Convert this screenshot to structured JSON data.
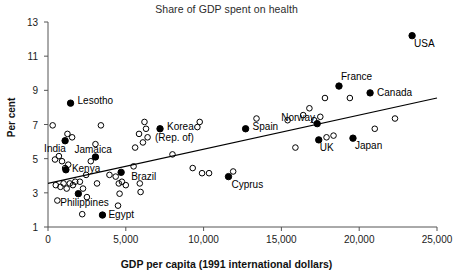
{
  "chart_data": {
    "type": "scatter",
    "title": "Share of GDP spent on health",
    "xlabel": "GDP per capita (1991 international dollars)",
    "ylabel": "Per cent",
    "xlim": [
      0,
      25000
    ],
    "ylim": [
      1,
      13
    ],
    "grid": false,
    "legend": "none",
    "xticks": [
      0,
      5000,
      10000,
      15000,
      20000,
      25000
    ],
    "xtick_labels": [
      "0",
      "5,000",
      "10,000",
      "15,000",
      "20,000",
      "25,000"
    ],
    "yticks": [
      1,
      3,
      5,
      7,
      9,
      11,
      13
    ],
    "ytick_labels": [
      "1",
      "3",
      "5",
      "7",
      "9",
      "11",
      "13"
    ],
    "marker_styles": {
      "labelled": "filled-circle",
      "unlabelled": "open-circle"
    },
    "trendline": {
      "type": "linear-fit",
      "x": [
        0,
        25000
      ],
      "y": [
        3.55,
        8.55
      ]
    },
    "labelled_points": [
      {
        "name": "USA",
        "x": 23400,
        "y": 12.2,
        "label_dx": 2,
        "label_dy": 11
      },
      {
        "name": "France",
        "x": 18700,
        "y": 9.25,
        "label_dx": 2,
        "label_dy": -6
      },
      {
        "name": "Canada",
        "x": 20700,
        "y": 8.85,
        "label_dx": 7,
        "label_dy": 3
      },
      {
        "name": "Lesotho",
        "x": 1450,
        "y": 8.25,
        "label_dx": 7,
        "label_dy": 1
      },
      {
        "name": "Norway",
        "x": 17300,
        "y": 7.05,
        "label_dx": -36,
        "label_dy": -3
      },
      {
        "name": "Spain",
        "x": 12700,
        "y": 6.75,
        "label_dx": 7,
        "label_dy": 1
      },
      {
        "name": "Korea (Rep. of)",
        "x": 7200,
        "y": 6.75,
        "label_dx": 7,
        "label_dy": 1
      },
      {
        "name": "Japan",
        "x": 19600,
        "y": 6.2,
        "label_dx": 2,
        "label_dy": 11
      },
      {
        "name": "UK",
        "x": 17400,
        "y": 6.1,
        "label_dx": 1,
        "label_dy": 11
      },
      {
        "name": "India",
        "x": 1100,
        "y": 6.05,
        "label_dx": -21,
        "label_dy": 11
      },
      {
        "name": "Jamaica",
        "x": 3050,
        "y": 5.1,
        "label_dx": -21,
        "label_dy": -4
      },
      {
        "name": "Kenya",
        "x": 1150,
        "y": 4.35,
        "label_dx": 6,
        "label_dy": 2
      },
      {
        "name": "Brazil",
        "x": 4700,
        "y": 4.2,
        "label_dx": 10,
        "label_dy": 8
      },
      {
        "name": "Cyprus",
        "x": 11600,
        "y": 3.95,
        "label_dx": 3,
        "label_dy": 11
      },
      {
        "name": "Philippines",
        "x": 1950,
        "y": 2.95,
        "label_dx": -18,
        "label_dy": 12
      },
      {
        "name": "Egypt",
        "x": 3500,
        "y": 1.7,
        "label_dx": 6,
        "label_dy": 3
      }
    ],
    "unlabelled_points": [
      {
        "x": 300,
        "y": 6.95
      },
      {
        "x": 700,
        "y": 5.15
      },
      {
        "x": 450,
        "y": 4.95
      },
      {
        "x": 900,
        "y": 4.85
      },
      {
        "x": 1250,
        "y": 6.45
      },
      {
        "x": 1550,
        "y": 6.25
      },
      {
        "x": 1300,
        "y": 4.65
      },
      {
        "x": 1100,
        "y": 4.45
      },
      {
        "x": 500,
        "y": 3.45
      },
      {
        "x": 800,
        "y": 3.35
      },
      {
        "x": 1000,
        "y": 3.55
      },
      {
        "x": 1200,
        "y": 3.25
      },
      {
        "x": 1400,
        "y": 3.55
      },
      {
        "x": 1600,
        "y": 3.45
      },
      {
        "x": 1750,
        "y": 3.65
      },
      {
        "x": 2050,
        "y": 3.65
      },
      {
        "x": 2250,
        "y": 3.25
      },
      {
        "x": 600,
        "y": 2.55
      },
      {
        "x": 2200,
        "y": 1.75
      },
      {
        "x": 3400,
        "y": 6.95
      },
      {
        "x": 3050,
        "y": 5.85
      },
      {
        "x": 2750,
        "y": 4.85
      },
      {
        "x": 2450,
        "y": 4.05
      },
      {
        "x": 3150,
        "y": 3.55
      },
      {
        "x": 2500,
        "y": 2.75
      },
      {
        "x": 3950,
        "y": 4.05
      },
      {
        "x": 4350,
        "y": 3.95
      },
      {
        "x": 4550,
        "y": 3.55
      },
      {
        "x": 4750,
        "y": 3.65
      },
      {
        "x": 5000,
        "y": 3.45
      },
      {
        "x": 4600,
        "y": 2.95
      },
      {
        "x": 4500,
        "y": 2.25
      },
      {
        "x": 5600,
        "y": 5.65
      },
      {
        "x": 5500,
        "y": 4.55
      },
      {
        "x": 5900,
        "y": 3.55
      },
      {
        "x": 5950,
        "y": 3.05
      },
      {
        "x": 6100,
        "y": 5.95
      },
      {
        "x": 6400,
        "y": 6.25
      },
      {
        "x": 6300,
        "y": 6.75
      },
      {
        "x": 5850,
        "y": 6.45
      },
      {
        "x": 6200,
        "y": 7.15
      },
      {
        "x": 8000,
        "y": 5.25
      },
      {
        "x": 9300,
        "y": 4.45
      },
      {
        "x": 9900,
        "y": 4.15
      },
      {
        "x": 10350,
        "y": 4.15
      },
      {
        "x": 9750,
        "y": 7.15
      },
      {
        "x": 9600,
        "y": 6.85
      },
      {
        "x": 11900,
        "y": 4.25
      },
      {
        "x": 15900,
        "y": 5.65
      },
      {
        "x": 15400,
        "y": 7.25
      },
      {
        "x": 16400,
        "y": 7.55
      },
      {
        "x": 16800,
        "y": 7.95
      },
      {
        "x": 17500,
        "y": 7.45
      },
      {
        "x": 17100,
        "y": 7.25
      },
      {
        "x": 17900,
        "y": 6.25
      },
      {
        "x": 18350,
        "y": 6.35
      },
      {
        "x": 17800,
        "y": 8.55
      },
      {
        "x": 19400,
        "y": 8.55
      },
      {
        "x": 21000,
        "y": 6.75
      },
      {
        "x": 22300,
        "y": 7.35
      },
      {
        "x": 13400,
        "y": 7.35
      }
    ]
  }
}
